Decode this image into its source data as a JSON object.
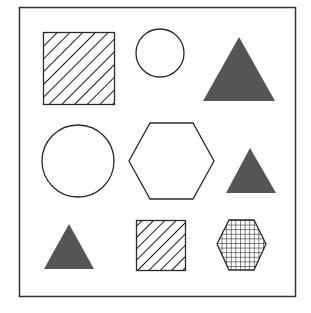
{
  "figure": {
    "width": 311,
    "height": 313,
    "frame": {
      "x": 19,
      "y": 7,
      "w": 276,
      "h": 289,
      "stroke": "#333333"
    },
    "colors": {
      "outline": "#2a2a2a",
      "fill_dark": "#555555",
      "background": "#ffffff"
    },
    "shapes": [
      {
        "id": "hatched-square-large",
        "type": "square",
        "fill": "diagonal-hatch",
        "x": 43,
        "y": 32,
        "w": 71,
        "h": 72
      },
      {
        "id": "circle-small",
        "type": "circle",
        "fill": "none",
        "cx": 160,
        "cy": 53,
        "r": 24
      },
      {
        "id": "triangle-large",
        "type": "triangle",
        "fill": "solid-dark",
        "points": "239,37 275,101 203,101"
      },
      {
        "id": "circle-large",
        "type": "circle",
        "fill": "none",
        "cx": 78,
        "cy": 161,
        "r": 36
      },
      {
        "id": "hexagon-large",
        "type": "hexagon",
        "fill": "none",
        "points": "150,123 193,123 214,161 193,199 150,199 129,161"
      },
      {
        "id": "triangle-medium",
        "type": "triangle",
        "fill": "solid-dark",
        "points": "250,148 276,193 226,193"
      },
      {
        "id": "triangle-small",
        "type": "triangle",
        "fill": "solid-dark",
        "points": "69,224 94,269 44,269"
      },
      {
        "id": "hatched-square-small",
        "type": "square",
        "fill": "diagonal-hatch",
        "x": 136,
        "y": 220,
        "w": 49,
        "h": 50
      },
      {
        "id": "grid-hexagon-small",
        "type": "hexagon",
        "fill": "grid",
        "points": "229,220 254,220 266,244 254,270 229,270 217,244"
      }
    ]
  }
}
